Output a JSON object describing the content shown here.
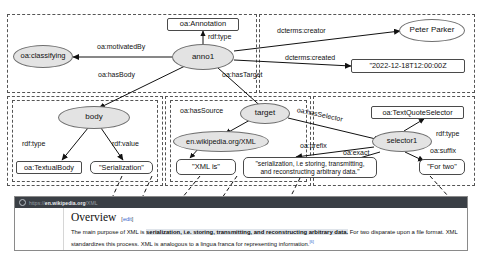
{
  "diagram": {
    "nodes": [
      {
        "id": "oa-annotation",
        "label": "oa:Annotation",
        "shape": "box"
      },
      {
        "id": "anno1",
        "label": "anno1",
        "shape": "ellipse"
      },
      {
        "id": "oa-classifying",
        "label": "oa:classifying",
        "shape": "ellipse"
      },
      {
        "id": "peter-parker",
        "label": "Peter Parker",
        "shape": "ellipse-plain"
      },
      {
        "id": "created-literal",
        "label": "\"2022-12-18T12:00:00Z",
        "shape": "box"
      },
      {
        "id": "body",
        "label": "body",
        "shape": "ellipse"
      },
      {
        "id": "oa-textualbody",
        "label": "oa:TextualBody",
        "shape": "box"
      },
      {
        "id": "serialization-literal",
        "label": "\"Serialization\"",
        "shape": "box"
      },
      {
        "id": "target",
        "label": "target",
        "shape": "ellipse"
      },
      {
        "id": "source-uri",
        "label": "en.wikipedia.org/XML",
        "shape": "ellipse"
      },
      {
        "id": "prefix-literal",
        "label": "\"XML is\"",
        "shape": "box"
      },
      {
        "id": "exact-literal",
        "label": "\"serialization, i.e storing, transmitting, and reconstructing arbitrary data.\"",
        "shape": "box"
      },
      {
        "id": "oa-textquoteselector",
        "label": "oa:TextQuoteSelector",
        "shape": "box"
      },
      {
        "id": "selector1",
        "label": "selector1",
        "shape": "ellipse"
      },
      {
        "id": "suffix-literal",
        "label": "\"For two\"",
        "shape": "box"
      }
    ],
    "edges": [
      {
        "from": "anno1",
        "to": "oa-annotation",
        "label": "rdf:type"
      },
      {
        "from": "anno1",
        "to": "oa-classifying",
        "label": "oa:motivatedBy"
      },
      {
        "from": "anno1",
        "to": "peter-parker",
        "label": "dcterms:creator"
      },
      {
        "from": "anno1",
        "to": "created-literal",
        "label": "dcterms:created"
      },
      {
        "from": "anno1",
        "to": "body",
        "label": "oa:hasBody"
      },
      {
        "from": "anno1",
        "to": "target",
        "label": "oa:hasTarget"
      },
      {
        "from": "body",
        "to": "oa-textualbody",
        "label": "rdf:type"
      },
      {
        "from": "body",
        "to": "serialization-literal",
        "label": "rdf:value"
      },
      {
        "from": "target",
        "to": "source-uri",
        "label": "oa:hasSource"
      },
      {
        "from": "target",
        "to": "selector1",
        "label": "oa:hasSelector"
      },
      {
        "from": "selector1",
        "to": "oa-textquoteselector",
        "label": "rdf:type"
      },
      {
        "from": "selector1",
        "to": "prefix-literal",
        "label": "oa:prefix"
      },
      {
        "from": "selector1",
        "to": "exact-literal",
        "label": "oa:exact"
      },
      {
        "from": "selector1",
        "to": "suffix-literal",
        "label": "oa:suffix"
      }
    ],
    "labels": {
      "rdf_type": "rdf:type",
      "rdf_value": "rdf:value",
      "oa_motivatedBy": "oa:motivatedBy",
      "oa_hasBody": "oa:hasBody",
      "oa_hasTarget": "oa:hasTarget",
      "oa_hasSource": "oa:hasSource",
      "oa_hasSelector": "oa:hasSelector",
      "oa_prefix": "oa:prefix",
      "oa_exact": "oa:exact",
      "oa_suffix": "oa:suffix",
      "dcterms_creator": "dcterms:creator",
      "dcterms_created": "dcterms:created"
    },
    "node_labels": {
      "oa_annotation": "oa:Annotation",
      "anno1": "anno1",
      "oa_classifying": "oa:classifying",
      "peter_parker": "Peter Parker",
      "created_literal": "\"2022-12-18T12:00:00Z",
      "body": "body",
      "oa_textualbody": "oa:TextualBody",
      "serialization_literal": "\"Serialization\"",
      "target": "target",
      "source_uri": "en.wikipedia.org/XML",
      "prefix_literal": "\"XML is\"",
      "exact_line1": "\"serialization, i.e storing, transmitting,",
      "exact_line2": "and reconstructing arbitrary data.\"",
      "oa_textquoteselector": "oa:TextQuoteSelector",
      "selector1": "selector1",
      "suffix_literal": "\"For two\""
    }
  },
  "browser": {
    "url_scheme": "https://",
    "url_host": "en.wikipedia.org",
    "url_path": "/XML",
    "heading": "Overview",
    "edit_bracket_open": "[",
    "edit_label": "edit",
    "edit_bracket_close": "]",
    "paragraph_pre": "The main purpose of XML is ",
    "paragraph_highlight": "serialization, i.e. storing, transmitting, and reconstructing arbitrary data.",
    "paragraph_post": " For two disparate upon a file format. XML standardizes this process. XML is analogous to a lingua franca for representing information.",
    "citation": "[6]"
  },
  "colors": {
    "node_fill": "#e3e3e3",
    "node_stroke": "#6f6f6f",
    "box_stroke": "#4a4a4a",
    "frame_stroke": "#555555",
    "urlbar_bg": "#3a3f45",
    "link_blue": "#3366cc",
    "highlight": "#dfe4ea"
  }
}
